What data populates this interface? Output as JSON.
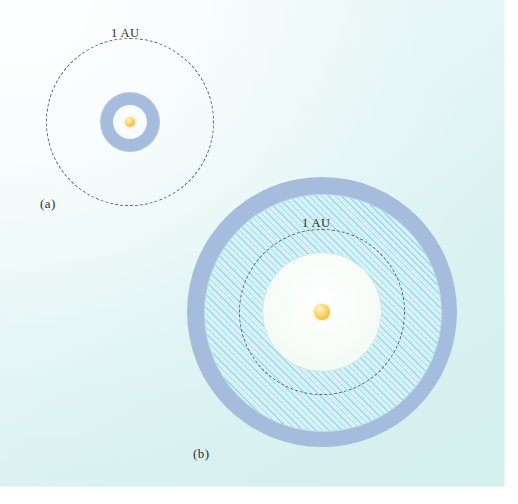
{
  "figure": {
    "background_color": "#ddf2f2"
  },
  "panels": [
    {
      "id": "a",
      "label": "(a)",
      "orbit_label": "1 AU",
      "center": {
        "x": 130,
        "y": 122
      },
      "star": {
        "radius": 5,
        "color": "#f3c44a"
      },
      "orbit": {
        "label": "1 AU",
        "radius": 84,
        "style": "dashed",
        "color": "#5a6274"
      },
      "zones": [
        {
          "name": "habitable-zone-band",
          "inner_radius": 17,
          "outer_radius": 30,
          "color": "#a6bcdd",
          "hatched": false
        },
        {
          "name": "inner-clear-disc",
          "inner_radius": 0,
          "outer_radius": 17,
          "color": "#f4fbff",
          "hatched": false
        }
      ]
    },
    {
      "id": "b",
      "label": "(b)",
      "orbit_label": "1 AU",
      "center": {
        "x": 322,
        "y": 312
      },
      "star": {
        "radius": 8,
        "color": "#f3c44a"
      },
      "orbit": {
        "label": "1 AU",
        "radius": 83,
        "style": "dashed",
        "color": "#5a6274"
      },
      "zones": [
        {
          "name": "outer-zone-band",
          "inner_radius": 118,
          "outer_radius": 135,
          "color": "#a6bcdd",
          "hatched": false
        },
        {
          "name": "habitable-zone-band",
          "inner_radius": 60,
          "outer_radius": 118,
          "color": "#d6f2f7",
          "hatched": true,
          "hatch_color": "#9fd9ea",
          "hatch_angle_deg": 45
        },
        {
          "name": "inner-clear-disc",
          "inner_radius": 0,
          "outer_radius": 60,
          "color": "#f2fbf7",
          "hatched": false
        }
      ]
    }
  ],
  "colors": {
    "band_blue": "#a6bcdd",
    "hatch_fill": "#d6f2f7",
    "hatch_line": "#9fd9ea",
    "star_gold": "#f3c44a",
    "dash_gray": "#5a6274",
    "page_tint": "#ddf2f2",
    "inner_white": "#f4fbff"
  }
}
